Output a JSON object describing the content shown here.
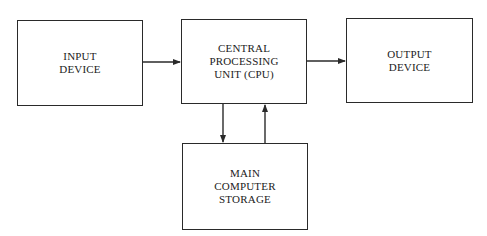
{
  "diagram": {
    "nodes": [
      {
        "id": "input",
        "label": "INPUT\nDEVICE"
      },
      {
        "id": "cpu",
        "label": "CENTRAL\nPROCESSING\nUNIT (CPU)"
      },
      {
        "id": "output",
        "label": "OUTPUT\nDEVICE"
      },
      {
        "id": "storage",
        "label": "MAIN\nCOMPUTER\nSTORAGE"
      }
    ],
    "edges": [
      {
        "from": "input",
        "to": "cpu"
      },
      {
        "from": "cpu",
        "to": "output"
      },
      {
        "from": "cpu",
        "to": "storage"
      },
      {
        "from": "storage",
        "to": "cpu"
      }
    ],
    "colors": {
      "line": "#2a2a2a",
      "background": "#ffffff"
    }
  }
}
